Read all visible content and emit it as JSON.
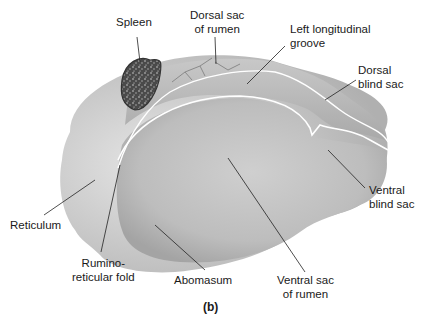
{
  "figure": {
    "caption": "(b)"
  },
  "labels": {
    "spleen": "Spleen",
    "dorsal_sac_line1": "Dorsal sac",
    "dorsal_sac_line2": "of rumen",
    "left_groove_line1": "Left longitudinal",
    "left_groove_line2": "groove",
    "dorsal_blind_line1": "Dorsal",
    "dorsal_blind_line2": "blind sac",
    "ventral_blind_line1": "Ventral",
    "ventral_blind_line2": "blind sac",
    "reticulum": "Reticulum",
    "rumino_line1": "Rumino-",
    "rumino_line2": "reticular fold",
    "abomasum": "Abomasum",
    "ventral_sac_line1": "Ventral sac",
    "ventral_sac_line2": "of rumen"
  },
  "colors": {
    "organ_light": "#d4d4d4",
    "organ_mid": "#b8b8b8",
    "organ_dark": "#9a9a9a",
    "spleen": "#555555",
    "leader": "#222222"
  }
}
